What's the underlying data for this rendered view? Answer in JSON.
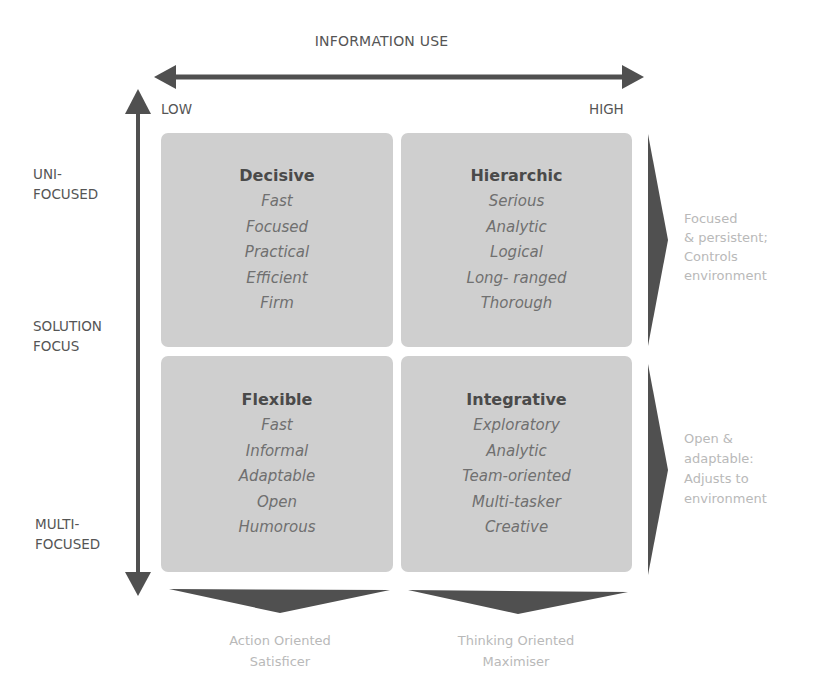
{
  "diagram": {
    "x_axis": {
      "title": "INFORMATION USE",
      "low_label": "LOW",
      "high_label": "HIGH"
    },
    "y_axis": {
      "top_label_line1": "UNI-",
      "top_label_line2": "FOCUSED",
      "middle_label_line1": "SOLUTION",
      "middle_label_line2": "FOCUS",
      "bottom_label_line1": "MULTI-",
      "bottom_label_line2": "FOCUSED"
    },
    "quadrants": [
      {
        "title": "Decisive",
        "traits": [
          "Fast",
          "Focused",
          "Practical",
          "Efficient",
          "Firm"
        ]
      },
      {
        "title": "Hierarchic",
        "traits": [
          "Serious",
          "Analytic",
          "Logical",
          "Long- ranged",
          "Thorough"
        ]
      },
      {
        "title": "Flexible",
        "traits": [
          "Fast",
          "Informal",
          "Adaptable",
          "Open",
          "Humorous"
        ]
      },
      {
        "title": "Integrative",
        "traits": [
          "Exploratory",
          "Analytic",
          "Team-oriented",
          "Multi-tasker",
          "Creative"
        ]
      }
    ],
    "right_annotations": [
      {
        "lines": [
          "Focused",
          "& persistent;",
          "Controls",
          "environment"
        ]
      },
      {
        "lines": [
          "Open &",
          "adaptable:",
          "Adjusts to",
          "environment"
        ]
      }
    ],
    "bottom_annotations": [
      {
        "line1": "Action Oriented",
        "line2": "Satisficer"
      },
      {
        "line1": "Thinking Oriented",
        "line2": "Maximiser"
      }
    ],
    "colors": {
      "arrow": "#505050",
      "quadrant_fill": "#cfcfcf",
      "annotation_text": "#b9b9b9"
    }
  }
}
